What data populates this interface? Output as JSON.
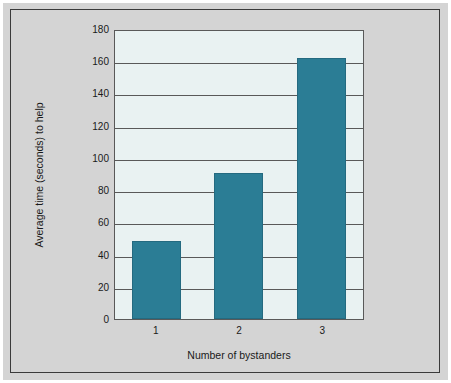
{
  "chart_data": {
    "type": "bar",
    "title": "",
    "subtitle": "",
    "categories": [
      "1",
      "2",
      "3"
    ],
    "values": [
      49,
      91,
      163
    ],
    "series": [
      {
        "name": "Average time to help",
        "values": [
          49,
          91,
          163
        ]
      }
    ],
    "xlabel": "Number of bystanders",
    "ylabel": "Average time (seconds) to help",
    "ylim": [
      0,
      180
    ],
    "xlim_categories": 3,
    "yticks": [
      180,
      160,
      140,
      120,
      100,
      80,
      60,
      40,
      20,
      0
    ],
    "ytick_labels": [
      "180",
      "160",
      "140",
      "120",
      "100",
      "80",
      "60",
      "40",
      "20",
      "0"
    ],
    "grid": {
      "horizontal": true,
      "vertical": false
    },
    "legend": {
      "visible": false,
      "position": "none"
    },
    "annotations": [],
    "colors": {
      "bar": "#2b7d95",
      "bar_edge": "#246a80",
      "plot_background": "#e9f2f2",
      "figure_background": "#d4d4d4",
      "page_background": "#ffffff",
      "gridline": "#595959",
      "axis": "#595959",
      "text": "#1a1a1a",
      "frame_border": "#3a3a3a"
    }
  }
}
